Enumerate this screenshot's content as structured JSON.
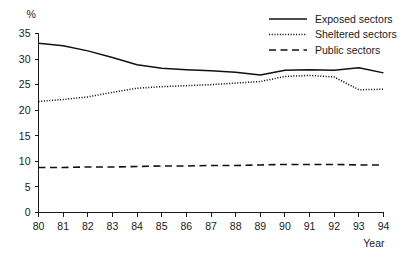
{
  "chart_data": {
    "type": "line",
    "title": "",
    "xlabel": "Year",
    "ylabel": "%",
    "x": [
      80,
      81,
      82,
      83,
      84,
      85,
      86,
      87,
      88,
      89,
      90,
      91,
      92,
      93,
      94
    ],
    "xticklabels": [
      "80",
      "81",
      "82",
      "83",
      "84",
      "85",
      "86",
      "87",
      "88",
      "89",
      "90",
      "91",
      "92",
      "93",
      "94"
    ],
    "yticklabels": [
      "0",
      "5",
      "10",
      "15",
      "20",
      "25",
      "30",
      "35"
    ],
    "yticks": [
      0,
      5,
      10,
      15,
      20,
      25,
      30,
      35
    ],
    "ylim": [
      0,
      35
    ],
    "xlim": [
      80,
      94
    ],
    "grid": false,
    "legend_position": "top-right",
    "series": [
      {
        "name": "Exposed sectors",
        "style": "solid",
        "color": "#111111",
        "values": [
          33.1,
          32.6,
          31.6,
          30.3,
          28.9,
          28.2,
          27.9,
          27.7,
          27.4,
          26.9,
          27.8,
          27.9,
          27.8,
          28.3,
          27.3
        ]
      },
      {
        "name": "Sheltered sectors",
        "style": "dotted",
        "color": "#111111",
        "values": [
          21.7,
          22.1,
          22.6,
          23.5,
          24.3,
          24.6,
          24.8,
          25.0,
          25.3,
          25.6,
          26.6,
          26.8,
          26.5,
          24.0,
          24.1
        ]
      },
      {
        "name": "Public sectors",
        "style": "dashed",
        "color": "#111111",
        "values": [
          8.8,
          8.8,
          8.9,
          8.9,
          9.0,
          9.1,
          9.1,
          9.2,
          9.2,
          9.3,
          9.4,
          9.4,
          9.4,
          9.3,
          9.3
        ]
      }
    ]
  }
}
